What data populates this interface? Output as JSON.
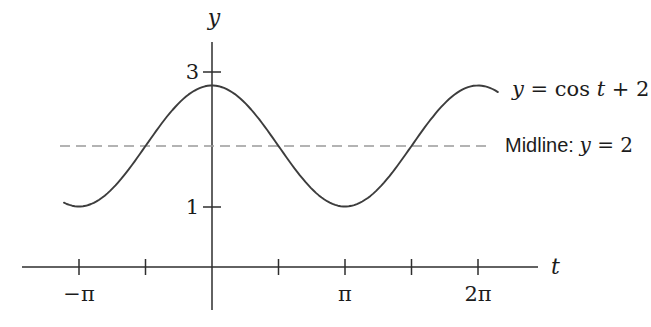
{
  "figure": {
    "background": "#ffffff"
  },
  "chart_data": {
    "type": "line",
    "title": "",
    "xlabel": "t",
    "ylabel": "y",
    "curve_label": "y = cos t + 2",
    "curve_label_parts": {
      "y": "y",
      "eq_cos": " = cos ",
      "t": "t",
      "plus": " + 2"
    },
    "midline_label": "Midline: y = 2",
    "midline_label_prefix": "Midline: ",
    "midline_label_math_y": "y",
    "midline_label_math_rest": " = 2",
    "function": {
      "form": "sinusoid",
      "expression": "y = cos(t) + 2",
      "amplitude": 1,
      "midline": 2,
      "period_label": "2π",
      "phase": 0,
      "domain_pi": [
        -1.113,
        2.15
      ]
    },
    "x_ticks": [
      {
        "value_pi": -1,
        "label": "−π"
      },
      {
        "value_pi": -0.5,
        "label": ""
      },
      {
        "value_pi": 0.5,
        "label": ""
      },
      {
        "value_pi": 1,
        "label": "π"
      },
      {
        "value_pi": 1.5,
        "label": ""
      },
      {
        "value_pi": 2,
        "label": "2π"
      }
    ],
    "y_ticks": [
      {
        "value": 3,
        "label": "3",
        "pixel_y": 72
      },
      {
        "value": 1,
        "label": "1",
        "pixel_y": 207
      }
    ],
    "key_points": {
      "maxima": [
        {
          "t": "0",
          "y": 3
        },
        {
          "t": "2π",
          "y": 3
        }
      ],
      "minima": [
        {
          "t": "−π",
          "y": 1
        },
        {
          "t": "π",
          "y": 1
        }
      ],
      "y_intercept": {
        "t": "0",
        "y": 3
      },
      "midline_y": 2
    },
    "colors": {
      "curve": "#3d3d3d",
      "axis": "#2e2e2e",
      "midline": "#9a9a9a",
      "text": "#1c1c1c"
    },
    "pixels": {
      "origin_x": 212,
      "origin_y": 267,
      "px_per_pi": 133,
      "px_per_unit_y": 60.5,
      "x_axis_x1": 22,
      "x_axis_x2": 538,
      "y_axis_y1": 42,
      "y_axis_y2": 310,
      "tick_half": 8,
      "y_tick_half": 9,
      "x_tick_label_baseline_y": 301,
      "midline_x1": 60,
      "midline_x2": 487,
      "midline_dash": "10 6"
    }
  }
}
